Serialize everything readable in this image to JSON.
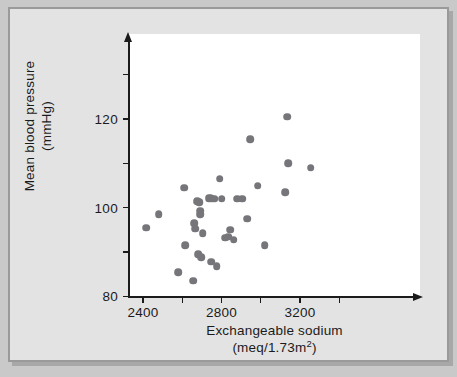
{
  "figure": {
    "background_color": "#e3e3e3",
    "plot_background_color": "#ffffff",
    "border_color": "#9a9a9a",
    "axis_color": "#1b1b1b",
    "point_color": "#76767a"
  },
  "chart_data": {
    "type": "scatter",
    "title": "",
    "xlabel": "Exchangeable sodium",
    "xlabel_units": "(meq/1.73m",
    "xlabel_units_sup": "2",
    "xlabel_units_end": ")",
    "ylabel_line1": "Mean blood pressure",
    "ylabel_line2": "(mmHg)",
    "ylabel": "Mean blood pressure (mmHg)",
    "xlim": [
      2330,
      3500
    ],
    "ylim": [
      80,
      134
    ],
    "grid": false,
    "legend": null,
    "x_ticks_major": [
      2400,
      2800,
      3200
    ],
    "x_ticks_minor": [
      2600,
      3000,
      3400
    ],
    "x_tick_labels": [
      "2400",
      "2800",
      "3200"
    ],
    "y_ticks_major": [
      80,
      100,
      120
    ],
    "y_ticks_minor": [
      90,
      110,
      130
    ],
    "y_tick_labels": [
      "80",
      "100",
      "120"
    ],
    "points": [
      {
        "x": 2415,
        "y": 95.5
      },
      {
        "x": 2480,
        "y": 98.5
      },
      {
        "x": 2580,
        "y": 85.5
      },
      {
        "x": 2610,
        "y": 104.5
      },
      {
        "x": 2615,
        "y": 91.5
      },
      {
        "x": 2655,
        "y": 83.5
      },
      {
        "x": 2660,
        "y": 96.5
      },
      {
        "x": 2665,
        "y": 95.3
      },
      {
        "x": 2675,
        "y": 101.5
      },
      {
        "x": 2680,
        "y": 89.5
      },
      {
        "x": 2685,
        "y": 101.3
      },
      {
        "x": 2690,
        "y": 99.3
      },
      {
        "x": 2692,
        "y": 98.6
      },
      {
        "x": 2698,
        "y": 88.8
      },
      {
        "x": 2705,
        "y": 94.2
      },
      {
        "x": 2735,
        "y": 102.2
      },
      {
        "x": 2745,
        "y": 102.2
      },
      {
        "x": 2748,
        "y": 87.8
      },
      {
        "x": 2755,
        "y": 102.0
      },
      {
        "x": 2765,
        "y": 102.0
      },
      {
        "x": 2775,
        "y": 86.8
      },
      {
        "x": 2790,
        "y": 106.5
      },
      {
        "x": 2800,
        "y": 102.0
      },
      {
        "x": 2820,
        "y": 93.2
      },
      {
        "x": 2835,
        "y": 93.5
      },
      {
        "x": 2845,
        "y": 95.0
      },
      {
        "x": 2862,
        "y": 92.8
      },
      {
        "x": 2880,
        "y": 102.0
      },
      {
        "x": 2905,
        "y": 102.0
      },
      {
        "x": 2930,
        "y": 97.5
      },
      {
        "x": 2945,
        "y": 115.5
      },
      {
        "x": 2985,
        "y": 105.0
      },
      {
        "x": 3020,
        "y": 91.5
      },
      {
        "x": 3125,
        "y": 103.5
      },
      {
        "x": 3135,
        "y": 120.5
      },
      {
        "x": 3140,
        "y": 110.0
      },
      {
        "x": 3255,
        "y": 109.0
      }
    ]
  }
}
